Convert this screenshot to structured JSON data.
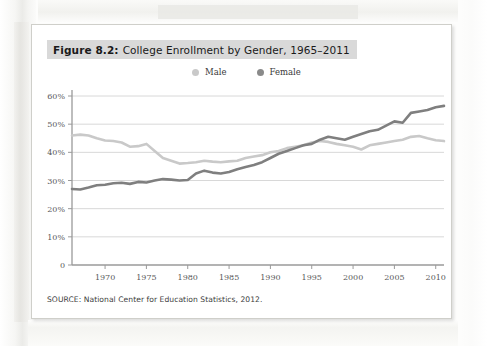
{
  "figure": {
    "caption_label": "Figure 8.2:",
    "caption_text": "College Enrollment by Gender, 1965–2011",
    "source": "SOURCE: National Center for Education Statistics, 2012."
  },
  "legend": {
    "items": [
      {
        "label": "Male",
        "color": "#c9c9c9"
      },
      {
        "label": "Female",
        "color": "#8a8a8a"
      }
    ]
  },
  "colors": {
    "male_line": "#c9c9c9",
    "female_line": "#7f7f7f",
    "grid": "#d8d8d8",
    "axis": "#9a9a9a",
    "caption_bar": "#d9d9d9",
    "page": "#ffffff"
  },
  "chart_data": {
    "type": "line",
    "title": "College Enrollment by Gender, 1965–2011",
    "xlabel": "",
    "ylabel": "",
    "grid": true,
    "legend_position": "top-center",
    "xlim": [
      1966,
      2011
    ],
    "ylim": [
      0,
      60
    ],
    "ytick_labels": [
      "0",
      "10%",
      "20%",
      "30%",
      "40%",
      "50%",
      "60%"
    ],
    "ytick_values": [
      0,
      10,
      20,
      30,
      40,
      50,
      60
    ],
    "xtick_labels": [
      "1970",
      "1975",
      "1980",
      "1985",
      "1990",
      "1995",
      "2000",
      "2005",
      "2010"
    ],
    "xtick_values": [
      1970,
      1975,
      1980,
      1985,
      1990,
      1995,
      2000,
      2005,
      2010
    ],
    "x": [
      1966,
      1967,
      1968,
      1969,
      1970,
      1971,
      1972,
      1973,
      1974,
      1975,
      1976,
      1977,
      1978,
      1979,
      1980,
      1981,
      1982,
      1983,
      1984,
      1985,
      1986,
      1987,
      1988,
      1989,
      1990,
      1991,
      1992,
      1993,
      1994,
      1995,
      1996,
      1997,
      1998,
      1999,
      2000,
      2001,
      2002,
      2003,
      2004,
      2005,
      2006,
      2007,
      2008,
      2009,
      2010,
      2011
    ],
    "series": [
      {
        "name": "Male",
        "color": "#c9c9c9",
        "values": [
          46.0,
          46.3,
          46.0,
          45.0,
          44.2,
          44.0,
          43.5,
          42.0,
          42.2,
          43.0,
          40.5,
          38.0,
          37.0,
          36.0,
          36.2,
          36.5,
          37.0,
          36.7,
          36.5,
          36.8,
          37.0,
          38.0,
          38.5,
          39.0,
          40.0,
          40.5,
          41.5,
          42.0,
          42.5,
          43.5,
          44.0,
          43.7,
          43.0,
          42.5,
          42.0,
          41.0,
          42.5,
          43.0,
          43.5,
          44.0,
          44.5,
          45.5,
          45.8,
          45.0,
          44.3,
          44.0
        ]
      },
      {
        "name": "Female",
        "color": "#7f7f7f",
        "values": [
          27.0,
          26.8,
          27.5,
          28.3,
          28.5,
          29.0,
          29.2,
          28.8,
          29.5,
          29.3,
          30.0,
          30.5,
          30.3,
          30.0,
          30.2,
          32.5,
          33.5,
          32.8,
          32.5,
          33.0,
          34.0,
          34.8,
          35.5,
          36.5,
          38.0,
          39.5,
          40.5,
          41.5,
          42.5,
          43.0,
          44.5,
          45.5,
          45.0,
          44.5,
          45.5,
          46.5,
          47.5,
          48.0,
          49.5,
          51.0,
          50.5,
          54.0,
          54.5,
          55.0,
          56.0,
          56.5
        ]
      }
    ]
  }
}
